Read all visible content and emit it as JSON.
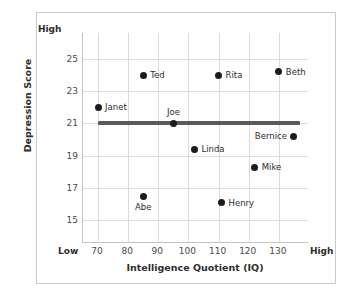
{
  "chart_data": {
    "type": "scatter",
    "title": "",
    "xlabel": "Intelligence Quotient (IQ)",
    "ylabel": "Depression Score",
    "xlim": [
      65,
      140
    ],
    "ylim": [
      13.6,
      26.6
    ],
    "x_ticks": [
      "70",
      "80",
      "90",
      "100",
      "110",
      "120",
      "130"
    ],
    "x_tick_values": [
      70,
      80,
      90,
      100,
      110,
      120,
      130
    ],
    "x_axis_low_label": "Low",
    "x_axis_high_label": "High",
    "y_ticks": [
      "15",
      "17",
      "19",
      "21",
      "23",
      "25"
    ],
    "y_tick_values": [
      15,
      17,
      19,
      21,
      23,
      25
    ],
    "y_axis_high_label": "High",
    "grid": true,
    "legend": "none",
    "reference_line": {
      "type": "horizontal",
      "y": 21,
      "x_start": 70,
      "x_end": 137,
      "color": "#5a5a5a",
      "label": ""
    },
    "point_color": "#1c1c1c",
    "points": [
      {
        "label": "Janet",
        "x": 70,
        "y": 22.0,
        "label_pos": "right"
      },
      {
        "label": "Ted",
        "x": 85,
        "y": 24.0,
        "label_pos": "right"
      },
      {
        "label": "Joe",
        "x": 95,
        "y": 21.0,
        "label_pos": "above"
      },
      {
        "label": "Rita",
        "x": 110,
        "y": 24.0,
        "label_pos": "right"
      },
      {
        "label": "Beth",
        "x": 130,
        "y": 24.2,
        "label_pos": "right"
      },
      {
        "label": "Bernice",
        "x": 135,
        "y": 20.2,
        "label_pos": "left"
      },
      {
        "label": "Linda",
        "x": 102,
        "y": 19.4,
        "label_pos": "right"
      },
      {
        "label": "Mike",
        "x": 122,
        "y": 18.3,
        "label_pos": "right"
      },
      {
        "label": "Abe",
        "x": 85,
        "y": 16.5,
        "label_pos": "below"
      },
      {
        "label": "Henry",
        "x": 111,
        "y": 16.1,
        "label_pos": "right"
      }
    ]
  }
}
